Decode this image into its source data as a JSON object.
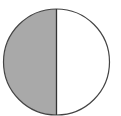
{
  "diagram": {
    "type": "half-shaded-circle",
    "shapes": {
      "circle": {
        "cx": 56.5,
        "cy": 62,
        "r": 53
      },
      "divider": {
        "x": 56.5
      }
    },
    "colors": {
      "shaded_fill": "#a9a9a9",
      "unshaded_fill": "#ffffff",
      "outline": "#444444"
    },
    "fraction_shaded": "1/2"
  }
}
